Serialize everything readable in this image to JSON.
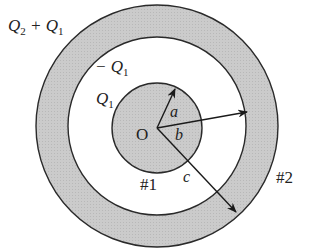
{
  "diagram": {
    "colors": {
      "fill": "#c8c8c8",
      "stroke": "#2a2a2a",
      "background": "#ffffff"
    },
    "labels": {
      "outer_charge": "Q",
      "outer_charge_sub2": "2",
      "outer_charge_plus": " + Q",
      "outer_charge_sub1": "1",
      "inner_surface_charge_minus": "− Q",
      "inner_surface_charge_sub": "1",
      "sphere_charge": "Q",
      "sphere_charge_sub": "1",
      "origin": "O",
      "radius_a": "a",
      "radius_b": "b",
      "radius_c": "c",
      "conductor_1": "#1",
      "conductor_2": "#2"
    }
  }
}
